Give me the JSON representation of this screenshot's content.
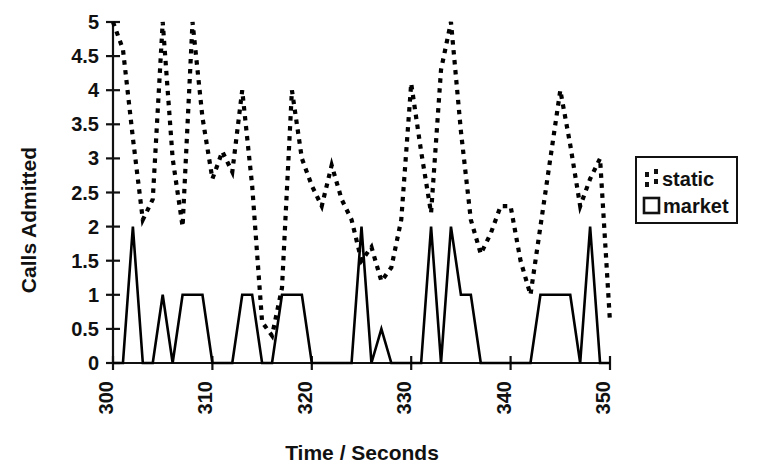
{
  "chart_data": {
    "type": "line",
    "title": "",
    "xlabel": "Time / Seconds",
    "ylabel": "Calls Admitted",
    "xlim": [
      300,
      350
    ],
    "ylim": [
      0,
      5
    ],
    "xticks": [
      300,
      310,
      320,
      330,
      340,
      350
    ],
    "yticks": [
      0,
      0.5,
      1,
      1.5,
      2,
      2.5,
      3,
      3.5,
      4,
      4.5,
      5
    ],
    "xtick_labels": [
      "300",
      "310",
      "320",
      "330",
      "340",
      "350"
    ],
    "ytick_labels": [
      "0",
      "0.5",
      "1",
      "1.5",
      "2",
      "2.5",
      "3",
      "3.5",
      "4",
      "4.5",
      "5"
    ],
    "grid": false,
    "legend_position": "right",
    "x": [
      300,
      301,
      302,
      303,
      304,
      305,
      306,
      307,
      308,
      309,
      310,
      311,
      312,
      313,
      314,
      315,
      316,
      317,
      318,
      319,
      320,
      321,
      322,
      323,
      324,
      325,
      326,
      327,
      328,
      329,
      330,
      331,
      332,
      333,
      334,
      335,
      336,
      337,
      338,
      339,
      340,
      341,
      342,
      343,
      344,
      345,
      346,
      347,
      348,
      349,
      350
    ],
    "series": [
      {
        "name": "static",
        "style": "dotted",
        "color": "#000000",
        "values": [
          5.0,
          4.6,
          3.3,
          2.1,
          2.4,
          5.0,
          3.0,
          2.0,
          5.0,
          3.6,
          2.7,
          3.1,
          2.8,
          4.0,
          2.6,
          0.6,
          0.4,
          1.1,
          4.0,
          3.0,
          2.6,
          2.3,
          2.9,
          2.4,
          2.1,
          1.5,
          1.7,
          1.2,
          1.4,
          2.1,
          4.1,
          3.1,
          2.2,
          4.3,
          5.0,
          3.4,
          2.1,
          1.6,
          1.9,
          2.3,
          2.3,
          1.5,
          1.0,
          2.0,
          3.0,
          4.0,
          3.2,
          2.3,
          2.7,
          3.0,
          0.6
        ]
      },
      {
        "name": "market",
        "style": "solid",
        "color": "#000000",
        "values": [
          0.0,
          0.0,
          2.0,
          0.0,
          0.0,
          1.0,
          0.0,
          1.0,
          1.0,
          1.0,
          0.0,
          0.0,
          0.0,
          1.0,
          1.0,
          0.0,
          0.0,
          1.0,
          1.0,
          1.0,
          0.0,
          0.0,
          0.0,
          0.0,
          0.0,
          2.0,
          0.0,
          0.5,
          0.0,
          0.0,
          0.0,
          0.0,
          2.0,
          0.0,
          2.0,
          1.0,
          1.0,
          0.0,
          0.0,
          0.0,
          0.0,
          0.0,
          0.0,
          1.0,
          1.0,
          1.0,
          1.0,
          0.0,
          2.0,
          0.0,
          0.0
        ]
      }
    ]
  },
  "legend": {
    "entries": [
      {
        "label": "static",
        "marker": "dotted-line-swatch"
      },
      {
        "label": "market",
        "marker": "open-square-swatch"
      }
    ]
  }
}
